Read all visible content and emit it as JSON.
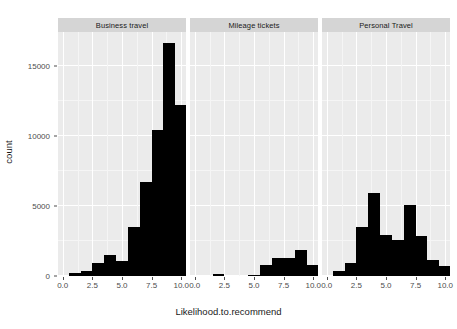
{
  "chart_data": {
    "type": "bar",
    "title": "",
    "subtitle": "",
    "xlabel": "Likelihood.to.recommend",
    "ylabel": "count",
    "xlim": [
      -0.4,
      10.4
    ],
    "ylim": [
      0,
      17400
    ],
    "grid": true,
    "legend": null,
    "facet_layout": "1 row x 3 columns",
    "x_ticks": [
      "0.0",
      "2.5",
      "5.0",
      "7.5",
      "10.0"
    ],
    "x_tick_values": [
      0.0,
      2.5,
      5.0,
      7.5,
      10.0
    ],
    "y_ticks": [
      "0",
      "5000",
      "10000",
      "15000"
    ],
    "y_tick_values": [
      0,
      5000,
      10000,
      15000
    ],
    "bin_centers": [
      0,
      1,
      2,
      3,
      4,
      5,
      6,
      7,
      8,
      9,
      10
    ],
    "facets": [
      {
        "label": "Business travel",
        "categories": [
          0,
          1,
          2,
          3,
          4,
          5,
          6,
          7,
          8,
          9,
          10
        ],
        "values": [
          0,
          180,
          330,
          900,
          1500,
          1050,
          3500,
          6700,
          10400,
          16600,
          12200
        ]
      },
      {
        "label": "Mileage tickets",
        "categories": [
          0,
          1,
          2,
          3,
          4,
          5,
          6,
          7,
          8,
          9,
          10
        ],
        "values": [
          0,
          0,
          110,
          0,
          0,
          60,
          750,
          1250,
          1300,
          1850,
          800
        ]
      },
      {
        "label": "Personal Travel",
        "categories": [
          0,
          1,
          2,
          3,
          4,
          5,
          6,
          7,
          8,
          9,
          10
        ],
        "values": [
          0,
          380,
          900,
          3500,
          5950,
          2900,
          2600,
          5050,
          2850,
          1150,
          700
        ]
      }
    ]
  },
  "axes": {
    "y_title": "count",
    "x_title": "Likelihood.to.recommend"
  },
  "colors": {
    "bar": "#000000",
    "panel_background": "#ebebeb",
    "strip_background": "#d5d5d5",
    "grid_major": "#ffffff",
    "grid_minor": "#f5f5f5",
    "text": "#4d4d4d",
    "title_text": "#1a1a1a"
  }
}
